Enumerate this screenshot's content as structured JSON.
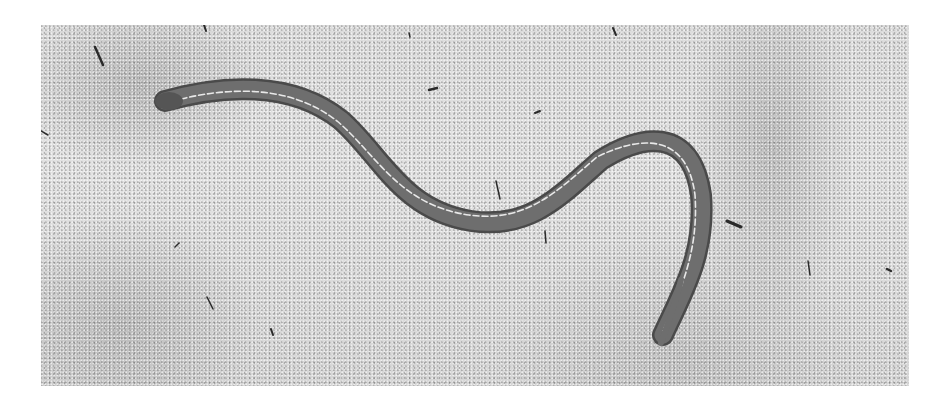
{
  "image": {
    "subject": "legless lizard on sand",
    "palette": {
      "background_page": "#ffffff",
      "sand": "#dcdcdc",
      "sand_shadow": "#9a9a9a",
      "body": "#6e6e6e",
      "body_dark": "#4a4a4a",
      "stripe": "#e8e8e8",
      "debris": "#2a2a2a"
    }
  }
}
